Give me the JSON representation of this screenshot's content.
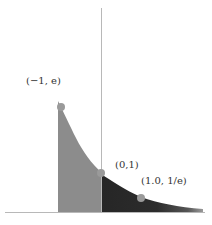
{
  "diagram": {
    "function": "y = e^(-x)",
    "points": [
      {
        "label": "(−1, e)",
        "x": -1,
        "y": 2.718
      },
      {
        "label": "(0,1)",
        "x": 0,
        "y": 1
      },
      {
        "label": "(1.0, 1/e)",
        "x": 1.0,
        "y": 0.368
      }
    ],
    "regions": [
      {
        "name": "left-region",
        "x_from": -1,
        "x_to": 0,
        "fill": "#8c8c8c"
      },
      {
        "name": "right-region",
        "x_from": 0,
        "x_to": 2.5,
        "fill": "#2a2a2a"
      }
    ],
    "colors": {
      "axis": "#b8b8b8",
      "point": "#9a9a9a",
      "left_fill": "#8c8c8c",
      "right_fill": "#2a2a2a",
      "background": "#ffffff"
    }
  }
}
